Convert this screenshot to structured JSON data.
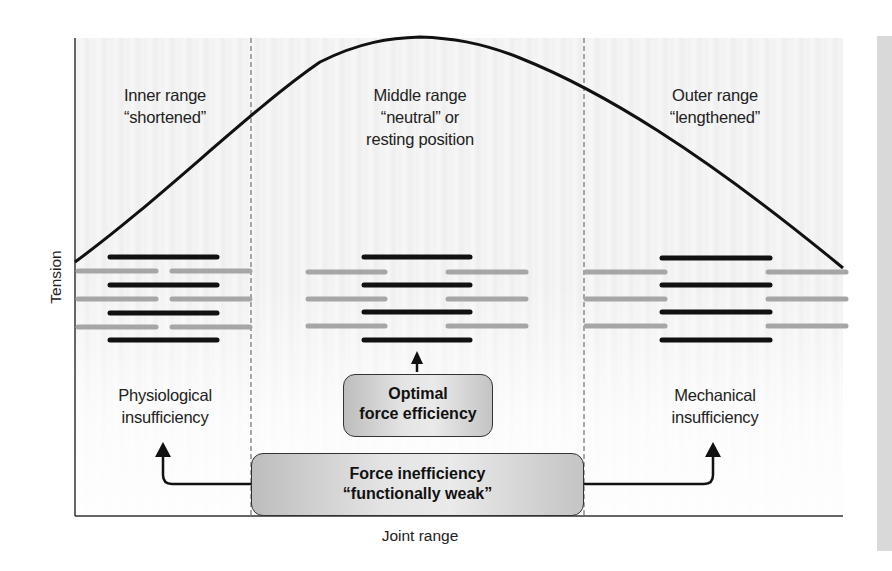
{
  "diagram": {
    "axes": {
      "y_label": "Tension",
      "x_label": "Joint range"
    },
    "regions": [
      {
        "id": "inner",
        "title": "Inner range",
        "subtitle": "“shortened”",
        "outcome": [
          "Physiological",
          "insufficiency"
        ]
      },
      {
        "id": "middle",
        "title": "Middle range",
        "subtitle": "“neutral” or",
        "subtitle2": "resting position"
      },
      {
        "id": "outer",
        "title": "Outer range",
        "subtitle": "“lengthened”",
        "outcome": [
          "Mechanical",
          "insufficiency"
        ]
      }
    ],
    "boxes": {
      "optimal": {
        "line1": "Optimal",
        "line2": "force efficiency"
      },
      "inefficiency": {
        "line1": "Force inefficiency",
        "line2": "“functionally weak”"
      }
    },
    "colors": {
      "curve": "#111111",
      "thick_filament": "#111111",
      "thin_filament": "#a6a6a6",
      "background": "#f2f2f2"
    }
  }
}
